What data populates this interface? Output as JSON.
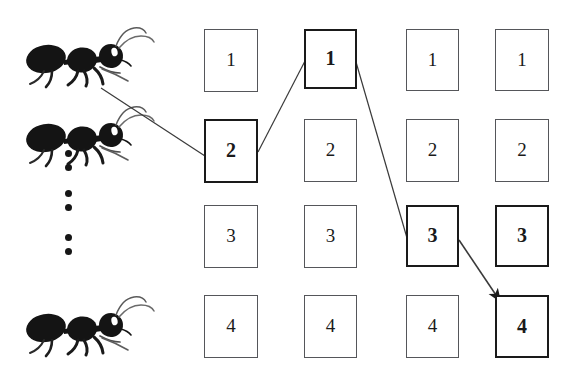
{
  "figure": {
    "type": "process-diagram",
    "background_color": "#ffffff",
    "line_color": "#3a3a3a",
    "ink_color": "#161616",
    "highlight_border_color": "#1a1a1a",
    "normal_border_color": "#55565a"
  },
  "grid": {
    "rows": 4,
    "columns": 4,
    "column_x": [
      204,
      304,
      406,
      495
    ],
    "row_y": [
      29,
      119,
      205,
      295
    ],
    "cell_width": 54,
    "cell_height": 63,
    "cells": [
      {
        "id": "c1r1",
        "label": "1",
        "column": 1,
        "row": 1,
        "highlighted": false,
        "x": 204,
        "y": 29,
        "w": 54,
        "h": 63
      },
      {
        "id": "c2r1",
        "label": "1",
        "column": 2,
        "row": 1,
        "highlighted": true,
        "x": 304,
        "y": 29,
        "w": 53,
        "h": 60
      },
      {
        "id": "c3r1",
        "label": "1",
        "column": 3,
        "row": 1,
        "highlighted": false,
        "x": 406,
        "y": 29,
        "w": 53,
        "h": 62
      },
      {
        "id": "c4r1",
        "label": "1",
        "column": 4,
        "row": 1,
        "highlighted": false,
        "x": 495,
        "y": 29,
        "w": 54,
        "h": 62
      },
      {
        "id": "c1r2",
        "label": "2",
        "column": 1,
        "row": 2,
        "highlighted": true,
        "x": 204,
        "y": 119,
        "w": 54,
        "h": 64
      },
      {
        "id": "c2r2",
        "label": "2",
        "column": 2,
        "row": 2,
        "highlighted": false,
        "x": 304,
        "y": 119,
        "w": 53,
        "h": 63
      },
      {
        "id": "c3r2",
        "label": "2",
        "column": 3,
        "row": 2,
        "highlighted": false,
        "x": 406,
        "y": 119,
        "w": 53,
        "h": 63
      },
      {
        "id": "c4r2",
        "label": "2",
        "column": 4,
        "row": 2,
        "highlighted": false,
        "x": 495,
        "y": 119,
        "w": 54,
        "h": 63
      },
      {
        "id": "c1r3",
        "label": "3",
        "column": 1,
        "row": 3,
        "highlighted": false,
        "x": 204,
        "y": 205,
        "w": 54,
        "h": 63
      },
      {
        "id": "c2r3",
        "label": "3",
        "column": 2,
        "row": 3,
        "highlighted": false,
        "x": 304,
        "y": 205,
        "w": 53,
        "h": 63
      },
      {
        "id": "c3r3",
        "label": "3",
        "column": 3,
        "row": 3,
        "highlighted": true,
        "x": 406,
        "y": 205,
        "w": 53,
        "h": 62
      },
      {
        "id": "c4r3",
        "label": "3",
        "column": 4,
        "row": 3,
        "highlighted": true,
        "x": 495,
        "y": 205,
        "w": 54,
        "h": 62
      },
      {
        "id": "c1r4",
        "label": "4",
        "column": 1,
        "row": 4,
        "highlighted": false,
        "x": 204,
        "y": 295,
        "w": 54,
        "h": 63
      },
      {
        "id": "c2r4",
        "label": "4",
        "column": 2,
        "row": 4,
        "highlighted": false,
        "x": 304,
        "y": 295,
        "w": 53,
        "h": 63
      },
      {
        "id": "c3r4",
        "label": "4",
        "column": 3,
        "row": 4,
        "highlighted": false,
        "x": 406,
        "y": 295,
        "w": 53,
        "h": 63
      },
      {
        "id": "c4r4",
        "label": "4",
        "column": 4,
        "row": 4,
        "highlighted": true,
        "x": 495,
        "y": 295,
        "w": 54,
        "h": 63
      }
    ]
  },
  "ants": [
    {
      "id": "ant-top",
      "x": 22,
      "y": 26,
      "facing": "right"
    },
    {
      "id": "ant-middle",
      "x": 22,
      "y": 105,
      "facing": "right"
    },
    {
      "id": "ant-bottom",
      "x": 22,
      "y": 295,
      "facing": "right"
    }
  ],
  "ellipsis_dots": {
    "x": 68,
    "y_positions": [
      153,
      167,
      193,
      207,
      237,
      251
    ],
    "count": 6,
    "radius": 3.5
  },
  "connections": [
    {
      "id": "ant-to-c1r2",
      "from": "ant-middle-antenna",
      "to": "c1r2",
      "x1": 101,
      "y1": 88,
      "x2": 205,
      "y2": 156,
      "arrow": false
    },
    {
      "id": "c1r2-to-c2r1",
      "from": "c1r2",
      "to": "c2r1",
      "x1": 258,
      "y1": 152,
      "x2": 305,
      "y2": 61,
      "arrow": false
    },
    {
      "id": "c2r1-to-c3r3",
      "from": "c2r1",
      "to": "c3r3",
      "x1": 356,
      "y1": 62,
      "x2": 407,
      "y2": 238,
      "arrow": false
    },
    {
      "id": "c3r3-to-c4r4",
      "from": "c3r3",
      "to": "c4r4",
      "x1": 459,
      "y1": 240,
      "x2": 500,
      "y2": 301,
      "arrow": true
    }
  ]
}
